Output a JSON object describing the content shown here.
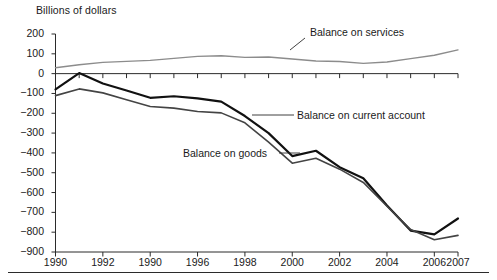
{
  "figure": {
    "axis_title": "Billions of dollars",
    "footer_rule": true
  },
  "chart_data": {
    "type": "line",
    "title": "",
    "subtitle": "",
    "xlabel": "",
    "ylabel": "Billions of dollars",
    "xlim": [
      1990,
      2007
    ],
    "ylim": [
      -900,
      200
    ],
    "ytick_step": 100,
    "grid": false,
    "legend_position": "inline-annotations",
    "x": [
      1990,
      1991,
      1992,
      1993,
      1994,
      1995,
      1996,
      1997,
      1998,
      1999,
      2000,
      2001,
      2002,
      2003,
      2004,
      2005,
      2006,
      2007
    ],
    "xtick_values": [
      1990,
      1992,
      1990,
      1996,
      1998,
      2000,
      2002,
      2004,
      2006,
      2007
    ],
    "xtick_positions": [
      1990,
      1992,
      1994,
      1996,
      1998,
      2000,
      2002,
      2004,
      2006,
      2007
    ],
    "ytick_labels": [
      "200",
      "100",
      "0",
      "-100",
      "-200",
      "-300",
      "-400",
      "-500",
      "-600",
      "-700",
      "-800",
      "-900"
    ],
    "ytick_values": [
      200,
      100,
      0,
      -100,
      -200,
      -300,
      -400,
      -500,
      -600,
      -700,
      -800,
      -900
    ],
    "series": [
      {
        "name": "Balance on services",
        "color": "#8c8c8c",
        "width": 1.4,
        "values": [
          30,
          45,
          57,
          62,
          67,
          77,
          87,
          90,
          82,
          84,
          74,
          64,
          61,
          52,
          59,
          76,
          93,
          120
        ]
      },
      {
        "name": "Balance on current account",
        "color": "#111111",
        "width": 2.2,
        "values": [
          -79,
          3,
          -50,
          -85,
          -122,
          -114,
          -125,
          -141,
          -214,
          -300,
          -416,
          -389,
          -472,
          -528,
          -665,
          -792,
          -811,
          -731
        ]
      },
      {
        "name": "Balance on goods",
        "color": "#444444",
        "width": 1.6,
        "values": [
          -111,
          -77,
          -97,
          -132,
          -166,
          -174,
          -191,
          -198,
          -248,
          -346,
          -452,
          -427,
          -482,
          -549,
          -669,
          -787,
          -838,
          -816
        ]
      }
    ],
    "annotations": [
      {
        "label": "Balance on services",
        "target_series": "Balance on services",
        "leader": "diagonal-down-left"
      },
      {
        "label": "Balance on current account",
        "target_series": "Balance on current account",
        "leader": "horizontal-left"
      },
      {
        "label": "Balance on goods",
        "target_series": "Balance on goods",
        "leader": "horizontal-right"
      }
    ]
  }
}
